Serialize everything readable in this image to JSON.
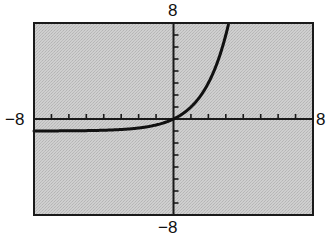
{
  "chart_data": {
    "type": "line",
    "title": "",
    "xlabel": "",
    "ylabel": "",
    "xlim": [
      -8,
      8
    ],
    "ylim": [
      -8,
      8
    ],
    "xscale": 1,
    "yscale": 1,
    "grid": false,
    "legend": null,
    "window_labels": {
      "xmin": "−8",
      "xmax": "8",
      "ymin": "−8",
      "ymax": "8"
    },
    "series": [
      {
        "name": "f(x)",
        "description": "exponential curve, horizontal asymptote near y = -1, passes through origin, rises steeply to the right",
        "x": [
          -8,
          -6,
          -4,
          -3,
          -2,
          -1,
          0,
          1,
          2,
          3,
          3.17
        ],
        "y": [
          -0.996,
          -0.984,
          -0.938,
          -0.875,
          -0.75,
          -0.5,
          0,
          1,
          3,
          7,
          8
        ]
      }
    ],
    "colors": {
      "background": "#c8c8c8",
      "frame": "#1a1a1a",
      "curve": "#111111",
      "axes": "#1a1a1a"
    }
  }
}
